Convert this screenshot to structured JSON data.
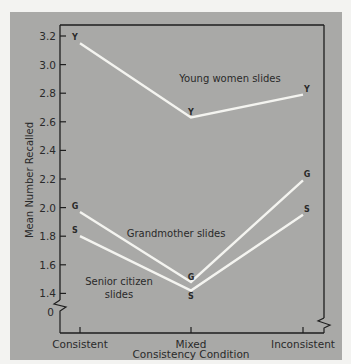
{
  "chart_data": {
    "type": "line",
    "title": "",
    "xlabel": "Consistency Condition",
    "ylabel": "Mean Number Recalled",
    "categories": [
      "Consistent",
      "Mixed",
      "Inconsistent"
    ],
    "y_ticks": [
      "0",
      "1.4",
      "1.6",
      "1.8",
      "2.0",
      "2.2",
      "2.4",
      "2.6",
      "2.8",
      "3.0",
      "3.2"
    ],
    "ylim": [
      1.3,
      3.25
    ],
    "axis_break": true,
    "grid": false,
    "series": [
      {
        "name": "Young women slides",
        "marker": "Y",
        "values": [
          3.15,
          2.63,
          2.79
        ]
      },
      {
        "name": "Grandmother slides",
        "marker": "G",
        "values": [
          1.97,
          1.48,
          2.19
        ]
      },
      {
        "name": "Senior citizen slides",
        "marker": "S",
        "values": [
          1.8,
          1.42,
          1.95
        ]
      }
    ],
    "annotations": [
      "Young women slides",
      "Grandmother slides",
      "Senior citizen slides"
    ]
  },
  "labels": {
    "xlabel": "Consistency Condition",
    "ylabel": "Mean Number Recalled",
    "cat0": "Consistent",
    "cat1": "Mixed",
    "cat2": "Inconsistent",
    "zero": "0",
    "young": "Young women slides",
    "grand": "Grandmother slides",
    "senior1": "Senior citizen",
    "senior2": "slides",
    "mY": "Y",
    "mG": "G",
    "mS": "S"
  },
  "colors": {
    "panel": "#a9a9a7",
    "line": "#f4f4f0",
    "axis": "#1e1e1e",
    "text": "#2a2a2a"
  }
}
